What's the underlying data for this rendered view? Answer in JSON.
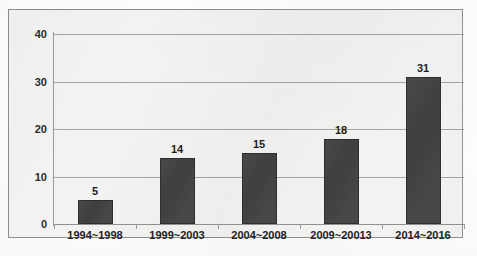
{
  "chart_data": {
    "type": "bar",
    "title": "",
    "xlabel": "",
    "ylabel": "",
    "categories": [
      "1994~1998",
      "1999~2003",
      "2004~2008",
      "2009~20013",
      "2014~2016"
    ],
    "values": [
      5,
      14,
      15,
      18,
      31
    ],
    "ylim": [
      0,
      40
    ],
    "yticks": [
      0,
      10,
      20,
      30,
      40
    ],
    "ytick_labels": [
      "0",
      "10",
      "20",
      "30",
      "40"
    ],
    "grid": true,
    "legend": false,
    "legend_position": "none",
    "series": [
      {
        "name": "",
        "values": [
          5,
          14,
          15,
          18,
          31
        ]
      }
    ],
    "data_labels": [
      "5",
      "14",
      "15",
      "18",
      "31"
    ],
    "colors": {
      "bar": "#3f3f3f",
      "bar_border": "#2e2e2e",
      "gridline": "#a2a2a2",
      "axis": "#9a9a9a",
      "frame_border": "#8d8d8d",
      "plot_background": "#f3f3f1",
      "text": "#1f1f1f"
    }
  }
}
